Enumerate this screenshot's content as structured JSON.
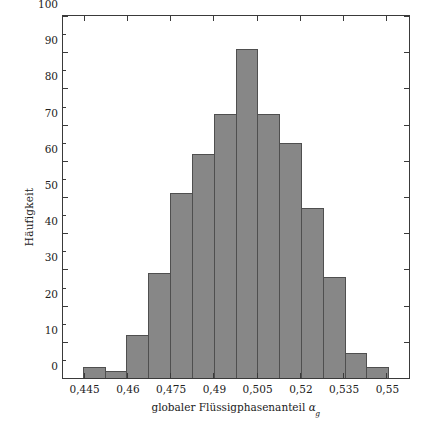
{
  "chart_data": {
    "type": "bar",
    "title": "",
    "xlabel": "globaler Flüssigphasenanteil αg",
    "xlabel_text": "globaler Flüssigphasenanteil",
    "xlabel_symbol": "α",
    "xlabel_symbol_subscript": "g",
    "ylabel": "Häufigkeit",
    "ylim": [
      0,
      100
    ],
    "xlim": [
      0.4375,
      0.5575
    ],
    "grid": false,
    "legend": null,
    "bin_width": 0.0075,
    "bin_edges": [
      0.4375,
      0.445,
      0.4525,
      0.46,
      0.4675,
      0.475,
      0.4825,
      0.49,
      0.4975,
      0.505,
      0.5125,
      0.52,
      0.5275,
      0.535,
      0.5425,
      0.55,
      0.5575
    ],
    "categories": [
      "0,4375-0,445",
      "0,445-0,4525",
      "0,4525-0,46",
      "0,46-0,4675",
      "0,4675-0,475",
      "0,475-0,4825",
      "0,4825-0,49",
      "0,49-0,4975",
      "0,4975-0,505",
      "0,505-0,5125",
      "0,5125-0,52",
      "0,52-0,5275",
      "0,5275-0,535",
      "0,535-0,5425",
      "0,5425-0,55",
      "0,55-0,5575"
    ],
    "values": [
      0,
      3,
      2,
      12,
      29,
      51,
      62,
      73,
      91,
      73,
      65,
      47,
      28,
      7,
      3,
      0
    ],
    "bars": [
      {
        "label": "0,4375-0,445",
        "value": 0
      },
      {
        "label": "0,445-0,4525",
        "value": 3
      },
      {
        "label": "0,4525-0,46",
        "value": 2
      },
      {
        "label": "0,46-0,4675",
        "value": 12
      },
      {
        "label": "0,4675-0,475",
        "value": 29
      },
      {
        "label": "0,475-0,4825",
        "value": 51
      },
      {
        "label": "0,4825-0,49",
        "value": 62
      },
      {
        "label": "0,49-0,4975",
        "value": 73
      },
      {
        "label": "0,4975-0,505",
        "value": 91
      },
      {
        "label": "0,505-0,5125",
        "value": 73
      },
      {
        "label": "0,5125-0,52",
        "value": 65
      },
      {
        "label": "0,52-0,5275",
        "value": 47
      },
      {
        "label": "0,5275-0,535",
        "value": 28
      },
      {
        "label": "0,535-0,5425",
        "value": 7
      },
      {
        "label": "0,5425-0,55",
        "value": 3
      },
      {
        "label": "0,55-0,5575",
        "value": 0
      }
    ],
    "yticks": [
      0,
      10,
      20,
      30,
      40,
      50,
      60,
      70,
      80,
      90,
      100
    ],
    "ytick_labels": [
      "0",
      "10",
      "20",
      "30",
      "40",
      "50",
      "60",
      "70",
      "80",
      "90",
      "100"
    ],
    "xticks": [
      0.445,
      0.46,
      0.475,
      0.49,
      0.505,
      0.52,
      0.535,
      0.55
    ],
    "xtick_labels": [
      "0,445",
      "0,46",
      "0,475",
      "0,49",
      "0,505",
      "0,52",
      "0,535",
      "0,55"
    ],
    "colors": {
      "bar_fill": "#878787",
      "bar_edge": "#4f4f4f",
      "axis": "#3a3a3a",
      "text": "#222222",
      "background": "#ffffff"
    }
  }
}
